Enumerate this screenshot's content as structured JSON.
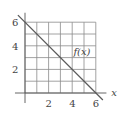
{
  "chart_data": {
    "type": "line",
    "title": "",
    "xlabel": "x",
    "ylabel": "",
    "xlim": [
      -1,
      7
    ],
    "ylim": [
      -1,
      7
    ],
    "grid": true,
    "grid_range": {
      "x": [
        0,
        6
      ],
      "y": [
        0,
        6
      ]
    },
    "x_ticks": [
      2,
      4,
      6
    ],
    "y_ticks": [
      2,
      4,
      6
    ],
    "x_tick_labels": [
      "2",
      "4",
      "6"
    ],
    "y_tick_labels": [
      "2",
      "4",
      "6"
    ],
    "series": [
      {
        "name": "f(x)",
        "x": [
          -0.6,
          6.6
        ],
        "y": [
          6.6,
          -0.6
        ]
      }
    ],
    "annotations": [
      {
        "text": "f(x)",
        "x": 4.1,
        "y": 3.2
      }
    ]
  }
}
